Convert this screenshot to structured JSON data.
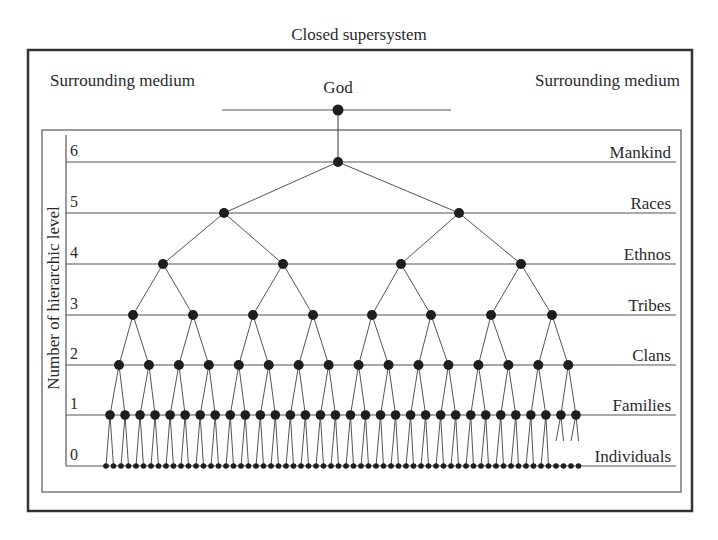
{
  "title": "Closed supersystem",
  "surrounding_left": "Surrounding medium",
  "surrounding_right": "Surrounding medium",
  "apex_label": "God",
  "y_axis_label": "Number of hierarchic level",
  "levels": [
    {
      "number": "6",
      "name": "Mankind",
      "y": 162,
      "nodes": 1
    },
    {
      "number": "5",
      "name": "Races",
      "y": 213,
      "nodes": 2
    },
    {
      "number": "4",
      "name": "Ethnos",
      "y": 264,
      "nodes": 4
    },
    {
      "number": "3",
      "name": "Tribes",
      "y": 315,
      "nodes": 8
    },
    {
      "number": "2",
      "name": "Clans",
      "y": 365,
      "nodes": 16
    },
    {
      "number": "1",
      "name": "Families",
      "y": 415,
      "nodes": 32
    },
    {
      "number": "0",
      "name": "Individuals",
      "y": 466,
      "nodes": 64
    }
  ],
  "colors": {
    "line": "#555555",
    "node": "#1e1e1e",
    "frame": "#333333",
    "text": "#2a2a2a"
  },
  "chart_data": {
    "type": "tree",
    "title": "Closed supersystem",
    "root": "God",
    "ylabel": "Number of hierarchic level",
    "levels": [
      {
        "level": 6,
        "name": "Mankind",
        "count": 1,
        "x": [
          338
        ]
      },
      {
        "level": 5,
        "name": "Races",
        "count": 2,
        "x": [
          224,
          459
        ]
      },
      {
        "level": 4,
        "name": "Ethnos",
        "count": 4,
        "x": [
          163,
          283,
          401,
          521
        ]
      },
      {
        "level": 3,
        "name": "Tribes",
        "count": 8,
        "x": [
          133,
          193,
          253,
          313,
          372,
          431,
          491,
          552
        ]
      },
      {
        "level": 2,
        "name": "Clans",
        "count": 16
      },
      {
        "level": 1,
        "name": "Families",
        "count": 32
      },
      {
        "level": 0,
        "name": "Individuals",
        "count": 64
      }
    ],
    "branching": 2
  }
}
